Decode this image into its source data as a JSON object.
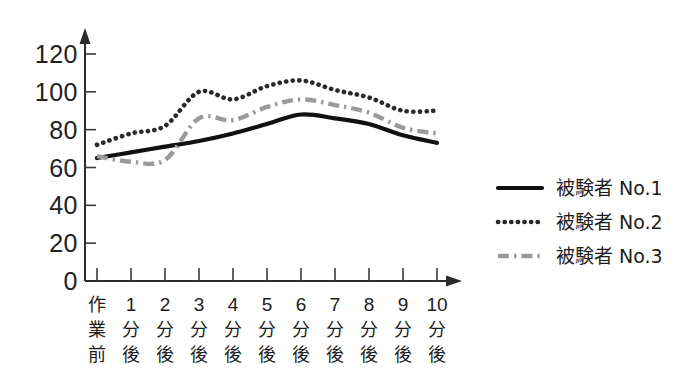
{
  "chart_data": {
    "type": "line",
    "title": "",
    "subtitle": "",
    "xlabel": "",
    "ylabel": "",
    "grid": false,
    "legend_position": "right",
    "ylim": [
      0,
      120
    ],
    "ytick_labels": [
      "0",
      "20",
      "40",
      "60",
      "80",
      "100",
      "120"
    ],
    "ytick_values": [
      0,
      20,
      40,
      60,
      80,
      100,
      120
    ],
    "categories": [
      "作業前",
      "1分後",
      "2分後",
      "3分後",
      "4分後",
      "5分後",
      "6分後",
      "7分後",
      "8分後",
      "9分後",
      "10分後"
    ],
    "category_parts": [
      {
        "num": "作",
        "mid": "業",
        "bot": "前"
      },
      {
        "num": "1",
        "mid": "分",
        "bot": "後"
      },
      {
        "num": "2",
        "mid": "分",
        "bot": "後"
      },
      {
        "num": "3",
        "mid": "分",
        "bot": "後"
      },
      {
        "num": "4",
        "mid": "分",
        "bot": "後"
      },
      {
        "num": "5",
        "mid": "分",
        "bot": "後"
      },
      {
        "num": "6",
        "mid": "分",
        "bot": "後"
      },
      {
        "num": "7",
        "mid": "分",
        "bot": "後"
      },
      {
        "num": "8",
        "mid": "分",
        "bot": "後"
      },
      {
        "num": "9",
        "mid": "分",
        "bot": "後"
      },
      {
        "num": "10",
        "mid": "分",
        "bot": "後"
      }
    ],
    "series": [
      {
        "name": "被験者 No.1",
        "style": "solid",
        "color": "#111111",
        "values": [
          65,
          68,
          71,
          74,
          78,
          83,
          88,
          86,
          83,
          77,
          73
        ]
      },
      {
        "name": "被験者 No.2",
        "style": "dotted",
        "color": "#2a2a2a",
        "values": [
          72,
          78,
          82,
          100,
          96,
          103,
          106,
          101,
          97,
          90,
          90
        ]
      },
      {
        "name": "被験者 No.3",
        "style": "dashdot",
        "color": "#9a9a9a",
        "values": [
          66,
          63,
          64,
          86,
          85,
          92,
          96,
          93,
          89,
          81,
          78
        ]
      }
    ]
  },
  "legend": {
    "entries": [
      {
        "label": "被験者 No.1",
        "style": "solid",
        "color": "#111111"
      },
      {
        "label": "被験者 No.2",
        "style": "dotted",
        "color": "#2a2a2a"
      },
      {
        "label": "被験者 No.3",
        "style": "dashdot",
        "color": "#9a9a9a"
      }
    ]
  }
}
